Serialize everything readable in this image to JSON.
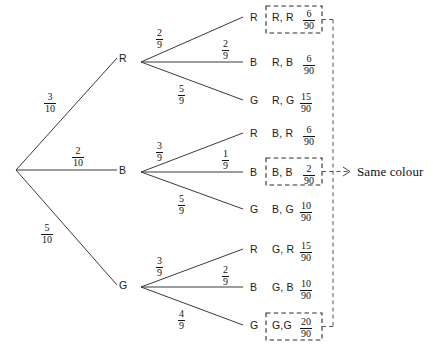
{
  "diagram": {
    "root_label": "",
    "annotation": "Same colour",
    "level1": [
      {
        "node": "R",
        "prob_num": "3",
        "prob_den": "10"
      },
      {
        "node": "B",
        "prob_num": "2",
        "prob_den": "10"
      },
      {
        "node": "G",
        "prob_num": "5",
        "prob_den": "10"
      }
    ],
    "level2": [
      {
        "parent": "R",
        "node": "R",
        "prob_num": "2",
        "prob_den": "9",
        "outcome": "R, R",
        "result_num": "6",
        "result_den": "90",
        "highlighted": true
      },
      {
        "parent": "R",
        "node": "B",
        "prob_num": "2",
        "prob_den": "9",
        "outcome": "R, B",
        "result_num": "6",
        "result_den": "90",
        "highlighted": false
      },
      {
        "parent": "R",
        "node": "G",
        "prob_num": "5",
        "prob_den": "9",
        "outcome": "R, G",
        "result_num": "15",
        "result_den": "90",
        "highlighted": false
      },
      {
        "parent": "B",
        "node": "R",
        "prob_num": "3",
        "prob_den": "9",
        "outcome": "B, R",
        "result_num": "6",
        "result_den": "90",
        "highlighted": false
      },
      {
        "parent": "B",
        "node": "B",
        "prob_num": "1",
        "prob_den": "9",
        "outcome": "B, B",
        "result_num": "2",
        "result_den": "90",
        "highlighted": true
      },
      {
        "parent": "B",
        "node": "G",
        "prob_num": "5",
        "prob_den": "9",
        "outcome": "B, G",
        "result_num": "10",
        "result_den": "90",
        "highlighted": false
      },
      {
        "parent": "G",
        "node": "R",
        "prob_num": "3",
        "prob_den": "9",
        "outcome": "G, R",
        "result_num": "15",
        "result_den": "90",
        "highlighted": false
      },
      {
        "parent": "G",
        "node": "B",
        "prob_num": "2",
        "prob_den": "9",
        "outcome": "G, B",
        "result_num": "10",
        "result_den": "90",
        "highlighted": false
      },
      {
        "parent": "G",
        "node": "G",
        "prob_num": "4",
        "prob_den": "9",
        "outcome": "G,G",
        "result_num": "20",
        "result_den": "90",
        "highlighted": true
      }
    ]
  },
  "colors": {
    "line": "#3a3a3a",
    "dashed_box": "#2b2b2b",
    "connector": "#555555",
    "text": "#1a1a1a",
    "background": "#ffffff"
  }
}
